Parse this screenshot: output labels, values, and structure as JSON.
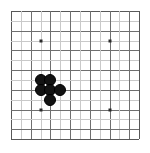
{
  "board": {
    "game": "Go",
    "kind": "go-board-diagram",
    "background_color": "#ffffff",
    "line_color_light": "#c9c9c9",
    "line_color_dark": "#6f6f6f",
    "edge_color": "#585858",
    "stone_color_black": "#131313",
    "star_point_color": "#2b2b2b",
    "columns": 14,
    "rows": 14,
    "cell_size_px": 9.85,
    "origin_x_px": 11,
    "origin_y_px": 11,
    "star_points": [
      {
        "col": 3,
        "row": 3
      },
      {
        "col": 10,
        "row": 3
      },
      {
        "col": 3,
        "row": 10
      },
      {
        "col": 10,
        "row": 10
      }
    ],
    "stones": [
      {
        "col": 3,
        "row": 7,
        "color": "black"
      },
      {
        "col": 4,
        "row": 7,
        "color": "black"
      },
      {
        "col": 3,
        "row": 8,
        "color": "black"
      },
      {
        "col": 4,
        "row": 8,
        "color": "black"
      },
      {
        "col": 5,
        "row": 8,
        "color": "black"
      },
      {
        "col": 4,
        "row": 9,
        "color": "black"
      }
    ],
    "stone_count_black": 6,
    "stone_count_white": 0
  }
}
